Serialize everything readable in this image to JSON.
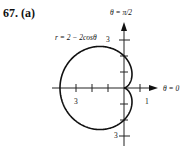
{
  "problem_label": "67. (a)",
  "chart_data": {
    "type": "line",
    "subtype": "polar",
    "title": "r = 2 − 2cosθ",
    "equation": "r = 2 - 2cos(theta)",
    "axis_labels": {
      "polar_axis": "θ = 0",
      "vertical_axis": "θ = π/2"
    },
    "tick_labels": [
      {
        "position": "negative-x",
        "value": "3"
      },
      {
        "position": "positive-x",
        "value": "1"
      },
      {
        "position": "positive-y",
        "value": "3"
      },
      {
        "position": "negative-y",
        "value": "3"
      }
    ],
    "x_range": [
      -4,
      1.5
    ],
    "y_range": [
      -3.5,
      3.5
    ],
    "grid": false,
    "key_points": [
      {
        "theta": "0",
        "r": 0
      },
      {
        "theta": "π/2",
        "r": 2
      },
      {
        "theta": "π",
        "r": 4
      },
      {
        "theta": "3π/2",
        "r": 2
      }
    ]
  },
  "labels": {
    "equation": "r = 2 − 2cosθ",
    "top_axis": "θ = π/2",
    "right_axis": "θ = 0",
    "tick_neg_x": "3",
    "tick_pos_x": "1",
    "tick_pos_y": "3",
    "tick_neg_y": "3"
  }
}
